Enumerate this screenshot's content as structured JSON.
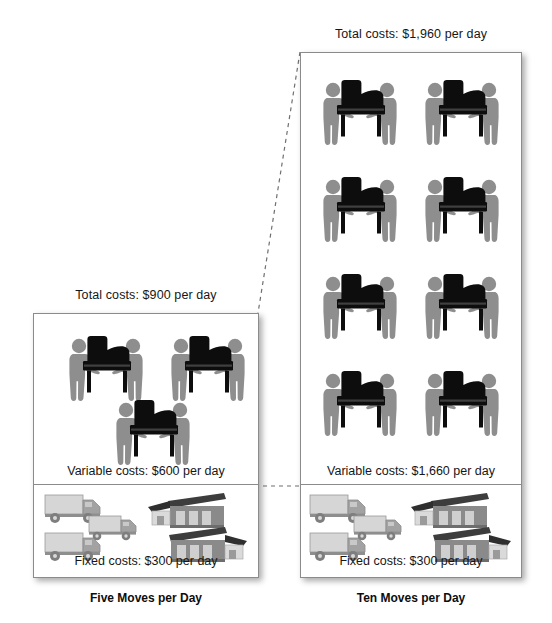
{
  "diagram": {
    "type": "cost-structure-comparison",
    "panels": [
      {
        "id": "five-moves",
        "title": "Five Moves per Day",
        "total_cost_label": "Total costs: $900 per day",
        "variable_cost_label": "Variable costs: $600 per day",
        "fixed_cost_label": "Fixed costs: $300 per day",
        "moves_per_day": 5,
        "total_cost": 900,
        "variable_cost": 600,
        "fixed_cost": 300,
        "piano_icon_count": 3,
        "truck_icon_count": 3,
        "warehouse_icon_count": 2
      },
      {
        "id": "ten-moves",
        "title": "Ten Moves per Day",
        "total_cost_label": "Total costs: $1,960 per day",
        "variable_cost_label": "Variable costs: $1,660 per day",
        "fixed_cost_label": "Fixed costs: $300 per day",
        "moves_per_day": 10,
        "total_cost": 1960,
        "variable_cost": 1660,
        "fixed_cost": 300,
        "piano_icon_count": 8,
        "truck_icon_count": 3,
        "warehouse_icon_count": 2
      }
    ],
    "icons": {
      "piano_mover": "piano-mover-icon",
      "truck": "delivery-truck-icon",
      "warehouse": "warehouse-icon"
    },
    "colors": {
      "piano_body": "#0d0d0d",
      "mover_figure": "#8e8e8e",
      "truck_body": "#d2d2d2",
      "truck_cab": "#9b9b9b",
      "warehouse_wall": "#8a8a8a",
      "warehouse_roof": "#3d3d3d",
      "panel_border": "#8b8b8b",
      "text": "#161616"
    }
  }
}
